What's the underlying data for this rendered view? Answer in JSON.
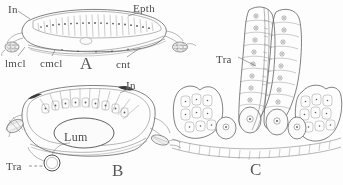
{
  "figure": {
    "kind": "histology-plate",
    "background_color": "#fdfdfc",
    "ink_color": "#565654",
    "panels": [
      {
        "id": "A",
        "letter": "A",
        "description": "Transverse section of a flattened tubular organ, epithelium above, connective tissue below",
        "labels": [
          {
            "key": "in_a",
            "text": "In",
            "x": 8,
            "y": 4
          },
          {
            "key": "epth_a",
            "text": "Epth",
            "x": 133,
            "y": 3
          },
          {
            "key": "lmcl_a",
            "text": "lmcl",
            "x": 5,
            "y": 58
          },
          {
            "key": "cmcl_a",
            "text": "cmcl",
            "x": 40,
            "y": 58
          },
          {
            "key": "cnt_a",
            "text": "cnt",
            "x": 116,
            "y": 59
          }
        ]
      },
      {
        "id": "B",
        "letter": "B",
        "description": "Transverse section showing open lumen lined by epithelium, with trachea below",
        "labels": [
          {
            "key": "in_b",
            "text": "In",
            "x": 126,
            "y": 80
          },
          {
            "key": "lum_b",
            "text": "Lum",
            "x": 64,
            "y": 131
          },
          {
            "key": "tra_b",
            "text": "Tra",
            "x": 6,
            "y": 163
          }
        ]
      },
      {
        "id": "C",
        "letter": "C",
        "description": "Detail of cell columns flanked by tissue masses, with tracheal tube between",
        "labels": [
          {
            "key": "tra_c",
            "text": "Tra",
            "x": 216,
            "y": 54
          }
        ]
      }
    ],
    "panel_letters": [
      {
        "key": "letter_a",
        "text": "A",
        "x": 80,
        "y": 56
      },
      {
        "key": "letter_b",
        "text": "B",
        "x": 112,
        "y": 163
      },
      {
        "key": "letter_c",
        "text": "C",
        "x": 250,
        "y": 162
      }
    ],
    "label_glossary": {
      "In": "In",
      "Epth": "Epth",
      "lmcl": "lmcl",
      "cmcl": "cmcl",
      "cnt": "cnt",
      "Lum": "Lum",
      "Tra": "Tra"
    }
  }
}
